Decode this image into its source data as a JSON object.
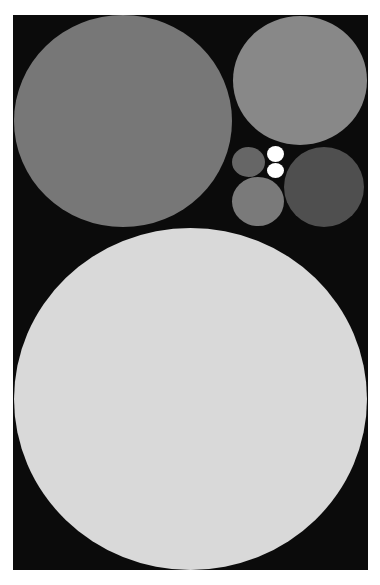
{
  "chart_data": {
    "type": "bubble-pack",
    "title": "",
    "xlabel": "",
    "ylabel": "",
    "legend": [],
    "background": "#0b0b0b",
    "plot_area": {
      "x": 13,
      "y": 15,
      "width": 355,
      "height": 555
    },
    "circles": [
      {
        "id": "large-light",
        "cx": 190.5,
        "cy": 399,
        "rx": 176.5,
        "ry": 171,
        "color": "#d9d9d9",
        "relative_size": 1.0
      },
      {
        "id": "top-left",
        "cx": 123,
        "cy": 121,
        "rx": 109,
        "ry": 106,
        "color": "#777777",
        "relative_size": 0.38
      },
      {
        "id": "top-right",
        "cx": 300,
        "cy": 80.5,
        "rx": 67,
        "ry": 64.5,
        "color": "#888888",
        "relative_size": 0.14
      },
      {
        "id": "dark-right",
        "cx": 324,
        "cy": 187,
        "rx": 40,
        "ry": 40,
        "color": "#4f4f4f",
        "relative_size": 0.052
      },
      {
        "id": "bottom-middle",
        "cx": 258,
        "cy": 201.5,
        "rx": 26,
        "ry": 24.5,
        "color": "#7a7a7a",
        "relative_size": 0.021
      },
      {
        "id": "small-left",
        "cx": 248.5,
        "cy": 162,
        "rx": 16.5,
        "ry": 15,
        "color": "#666666",
        "relative_size": 0.008
      },
      {
        "id": "white-top",
        "cx": 275.5,
        "cy": 154,
        "rx": 8.5,
        "ry": 8,
        "color": "#ffffff",
        "relative_size": 0.002
      },
      {
        "id": "white-bottom",
        "cx": 275.5,
        "cy": 170.5,
        "rx": 8.5,
        "ry": 7.5,
        "color": "#ffffff",
        "relative_size": 0.002
      }
    ]
  }
}
